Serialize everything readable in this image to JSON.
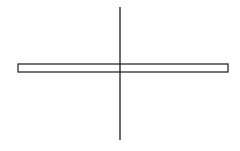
{
  "diagram": {
    "background": "#ffffff",
    "stroke_color": "#1a1a1a",
    "horizontal_bar": {
      "x": 18,
      "y": 64,
      "width": 210,
      "height": 8,
      "fill": "#ffffff"
    },
    "vertical_line": {
      "x": 120,
      "y1": 7,
      "y2": 140
    }
  }
}
